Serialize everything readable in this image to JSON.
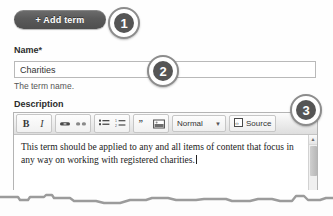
{
  "toolbar_top": {
    "add_term_label": "+ Add term"
  },
  "badges": [
    {
      "number": "1"
    },
    {
      "number": "2"
    },
    {
      "number": "3"
    }
  ],
  "name_field": {
    "label": "Name",
    "required_mark": "*",
    "value": "Charities",
    "placeholder": "",
    "help_text": "The term name."
  },
  "description_field": {
    "label": "Description",
    "body_text": "This term should be applied to any and all items of content that focus in any way on working with registered charities.",
    "editor_toolbar": {
      "groups": [
        {
          "name": "basic-styles",
          "buttons": [
            {
              "icon": "bold-icon",
              "label": "B"
            },
            {
              "icon": "italic-icon",
              "label": "I"
            }
          ]
        },
        {
          "name": "links",
          "buttons": [
            {
              "icon": "link-icon",
              "label": ""
            },
            {
              "icon": "unlink-icon",
              "label": ""
            }
          ]
        },
        {
          "name": "lists",
          "buttons": [
            {
              "icon": "bulleted-list-icon",
              "label": ""
            },
            {
              "icon": "numbered-list-icon",
              "label": ""
            }
          ]
        },
        {
          "name": "insert",
          "buttons": [
            {
              "icon": "blockquote-icon",
              "label": "”"
            },
            {
              "icon": "image-icon",
              "label": ""
            }
          ]
        }
      ],
      "format_select": {
        "value": "Normal",
        "arrow_icon": "chevron-down-icon"
      },
      "source_button": {
        "label": "Source",
        "icon": "source-code-icon"
      }
    },
    "scrollbar": {
      "up_arrow_icon": "triangle-up-icon"
    }
  },
  "colors": {
    "button_dark": "#5a5a5a",
    "badge_fill": "#555555",
    "border": "#b4b4b4",
    "toolbar_bg": "#ebebeb"
  }
}
